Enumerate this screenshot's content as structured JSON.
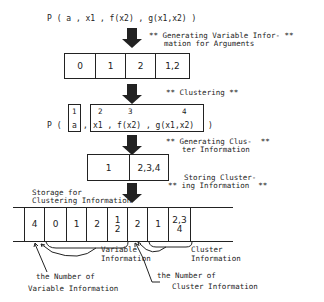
{
  "predicate_line": "P ( a , x1 , f(x2) , g(x1,x2) )",
  "step1": {
    "label_line1": "** Generating Variable Infor- **",
    "label_line2": "mation for Arguments",
    "cells": [
      "0",
      "1",
      "2",
      "1,2"
    ]
  },
  "step2": {
    "label": "** Clustering **",
    "cluster_numbers": [
      "1",
      "2",
      "3",
      "4"
    ],
    "prefix": "P (",
    "arg_a": "a",
    "comma": ",",
    "rest_args": "x1 , f(x2) , g(x1,x2)",
    "suffix": ")"
  },
  "step3": {
    "label_line1": "** Generating Clus-  **",
    "label_line2": "ter Information",
    "cells": [
      "1",
      "2,3,4"
    ]
  },
  "step4": {
    "label_line1": "Storing Cluster-",
    "label_line2": "** ing Information  **"
  },
  "storage": {
    "title_line1": "Storage for",
    "title_line2": "Clustering Information",
    "cells": [
      {
        "top": "4",
        "bottom": ""
      },
      {
        "top": "0",
        "bottom": ""
      },
      {
        "top": "1",
        "bottom": ""
      },
      {
        "top": "2",
        "bottom": ""
      },
      {
        "top": "1",
        "bottom": "2"
      },
      {
        "top": "2",
        "bottom": ""
      },
      {
        "top": "1",
        "bottom": ""
      },
      {
        "top": "2,3",
        "bottom": "4"
      }
    ]
  },
  "annotations": {
    "variable_info_line1": "Variable",
    "variable_info_line2": "Information",
    "cluster_info_line1": "Cluster",
    "cluster_info_line2": "Information",
    "num_var_line1": "the Number of",
    "num_var_line2": "Variable Information",
    "num_cluster_line1": "the Number of",
    "num_cluster_line2": "Cluster Information"
  }
}
